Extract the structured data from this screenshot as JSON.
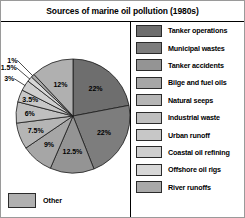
{
  "header": {
    "title": "Sources of marine oil pollution (1980s)"
  },
  "legend": {
    "items": [
      {
        "label": "Tanker operations",
        "color": "#6e6e6e"
      },
      {
        "label": "Municipal wastes",
        "color": "#7d7d7d"
      },
      {
        "label": "Tanker accidents",
        "color": "#949494"
      },
      {
        "label": "Bilge and fuel oils",
        "color": "#a6a6a6"
      },
      {
        "label": "Natural seeps",
        "color": "#b5b5b5"
      },
      {
        "label": "Industrial waste",
        "color": "#bfbfbf"
      },
      {
        "label": "Urban runoff",
        "color": "#c7c7c7"
      },
      {
        "label": "Coastal oil refining",
        "color": "#cfcfcf"
      },
      {
        "label": "Offshore oil rigs",
        "color": "#d7d7d7"
      },
      {
        "label": "River runoffs",
        "color": "#a9a9a9"
      }
    ]
  },
  "other": {
    "label": "Other",
    "color": "#b0b0b0"
  },
  "chart_data": {
    "type": "pie",
    "title": "Sources of marine oil pollution (1980s)",
    "legend_position": "right",
    "start_angle_deg": 0,
    "direction": "clockwise",
    "categories": [
      "Tanker operations",
      "Municipal wastes",
      "Tanker accidents",
      "Bilge and fuel oils",
      "Natural seeps",
      "Industrial waste",
      "Urban runoff",
      "Coastal oil refining",
      "Offshore oil rigs",
      "River runoffs",
      "Other"
    ],
    "values": [
      22,
      22,
      12.5,
      9,
      7.5,
      6,
      3.5,
      3,
      1.5,
      1,
      12
    ],
    "value_labels": [
      "22%",
      "22%",
      "12.5%",
      "9%",
      "7.5%",
      "6%",
      "3.5%",
      "3%",
      "1.5%",
      "1%",
      "12%"
    ],
    "colors": [
      "#6e6e6e",
      "#7d7d7d",
      "#949494",
      "#a6a6a6",
      "#b5b5b5",
      "#bfbfbf",
      "#c7c7c7",
      "#cfcfcf",
      "#d7d7d7",
      "#a9a9a9",
      "#b0b0b0"
    ],
    "units": "percent",
    "total": 100
  }
}
